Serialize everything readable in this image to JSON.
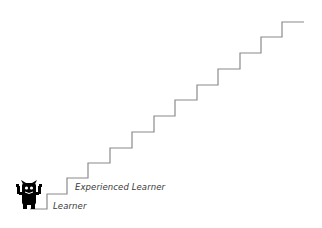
{
  "diagram": {
    "type": "staircase",
    "stroke_color": "#8a8a8a",
    "step_count": 12,
    "base": {
      "x_start": 30,
      "x_end": 47,
      "y": 209
    },
    "risers_x": [
      47,
      67,
      88,
      110,
      132,
      154,
      175,
      197,
      218,
      240,
      261,
      282
    ],
    "treads_y": [
      194,
      178,
      163,
      148,
      132,
      116,
      100,
      85,
      69,
      53,
      37,
      22
    ],
    "top_end_x": 304
  },
  "labels": {
    "experienced": "Experienced Learner",
    "learner": "Learner"
  },
  "character": {
    "icon": "monster-icon",
    "color": "#000000"
  }
}
